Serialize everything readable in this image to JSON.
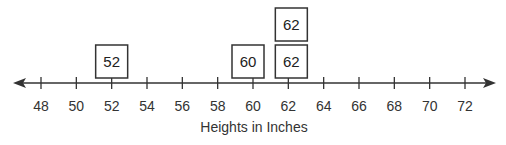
{
  "chart_data": {
    "type": "dot_plot",
    "title": "",
    "xlabel": "Heights in Inches",
    "ylabel": "",
    "xlim": [
      48,
      72
    ],
    "tick_step": 2,
    "ticks": [
      48,
      50,
      52,
      54,
      56,
      58,
      60,
      62,
      64,
      66,
      68,
      70,
      72
    ],
    "tick_labels": [
      "48",
      "50",
      "52",
      "54",
      "56",
      "58",
      "60",
      "62",
      "64",
      "66",
      "68",
      "70",
      "72"
    ],
    "values": [
      52,
      60,
      62,
      62
    ],
    "points": [
      {
        "x": 52,
        "stack": 0,
        "label": "52"
      },
      {
        "x": 60,
        "stack": 0,
        "label": "60"
      },
      {
        "x": 62,
        "stack": 0,
        "label": "62"
      },
      {
        "x": 62,
        "stack": 1,
        "label": "62"
      }
    ],
    "marker": "labeled-box",
    "grid": false,
    "legend": null
  },
  "colors": {
    "axis": "#333333",
    "box_border": "#333333",
    "text": "#333333",
    "background": "#ffffff"
  }
}
